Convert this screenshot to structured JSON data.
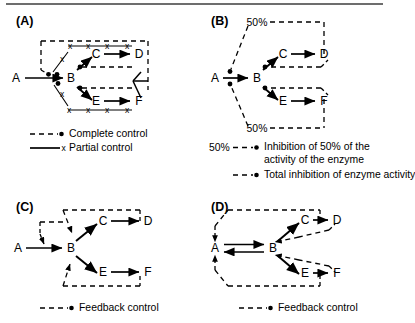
{
  "figure": {
    "type": "diagram",
    "panels": [
      {
        "id": "A",
        "label": "(A)",
        "nodes": [
          "A",
          "B",
          "C",
          "D",
          "E",
          "F"
        ],
        "pathway": "A to B, B to C to D, B to E to F",
        "legend": [
          {
            "marker": "dashed-with-dot",
            "label": "Complete control"
          },
          {
            "marker": "solid-with-x",
            "label": "Partial control"
          }
        ],
        "marks": {
          "x": "x"
        }
      },
      {
        "id": "B",
        "label": "(B)",
        "nodes": [
          "A",
          "B",
          "C",
          "D",
          "E",
          "F"
        ],
        "pathway": "A to B, B to C to D, B to E to F",
        "percent_top": "50%",
        "percent_bottom": "50%",
        "legend": [
          {
            "marker": "dashed-with-dot",
            "label": "Inhibition of 50% of the activity of the enzyme"
          },
          {
            "marker": "dashed-with-dot",
            "label": "Total inhibition of enzyme activity"
          }
        ],
        "legend_prefix": "50%"
      },
      {
        "id": "C",
        "label": "(C)",
        "nodes": [
          "A",
          "B",
          "C",
          "D",
          "E",
          "F"
        ],
        "pathway": "A to B, B to C to D, B to E to F",
        "legend": [
          {
            "marker": "dashed-with-dot",
            "label": "Feedback control"
          }
        ]
      },
      {
        "id": "D",
        "label": "(D)",
        "nodes": [
          "A",
          "B",
          "C",
          "D",
          "E",
          "F"
        ],
        "pathway": "A reversible B, B to C to D, B to E to F",
        "legend": [
          {
            "marker": "dashed-with-dot",
            "label": "Feedback control"
          }
        ]
      }
    ],
    "colors": {
      "ink": "#000000",
      "rule": "#6d6d6d",
      "background": "#ffffff"
    }
  },
  "panelA": {
    "label": "(A)",
    "nodes": {
      "A": "A",
      "B": "B",
      "C": "C",
      "D": "D",
      "E": "E",
      "F": "F"
    },
    "x1": "x",
    "x2": "x",
    "x3": "x",
    "x4": "x",
    "x5": "x",
    "x6": "x",
    "x7": "x",
    "x8": "x",
    "x9": "x",
    "x10": "x",
    "legend_complete": "Complete control",
    "legend_partial": "Partial control"
  },
  "panelB": {
    "label": "(B)",
    "nodes": {
      "A": "A",
      "B": "B",
      "C": "C",
      "D": "D",
      "E": "E",
      "F": "F"
    },
    "pct_top": "50%",
    "pct_bottom": "50%",
    "legend_pct": "50%",
    "legend_inhibition": "Inhibition of 50% of the activity of the enzyme",
    "legend_total": "Total inhibition of enzyme activity"
  },
  "panelC": {
    "label": "(C)",
    "nodes": {
      "A": "A",
      "B": "B",
      "C": "C",
      "D": "D",
      "E": "E",
      "F": "F"
    },
    "legend_feedback": "Feedback control"
  },
  "panelD": {
    "label": "(D)",
    "nodes": {
      "A": "A",
      "B": "B",
      "C": "C",
      "D": "D",
      "E": "E",
      "F": "F"
    },
    "legend_feedback": "Feedback control"
  }
}
